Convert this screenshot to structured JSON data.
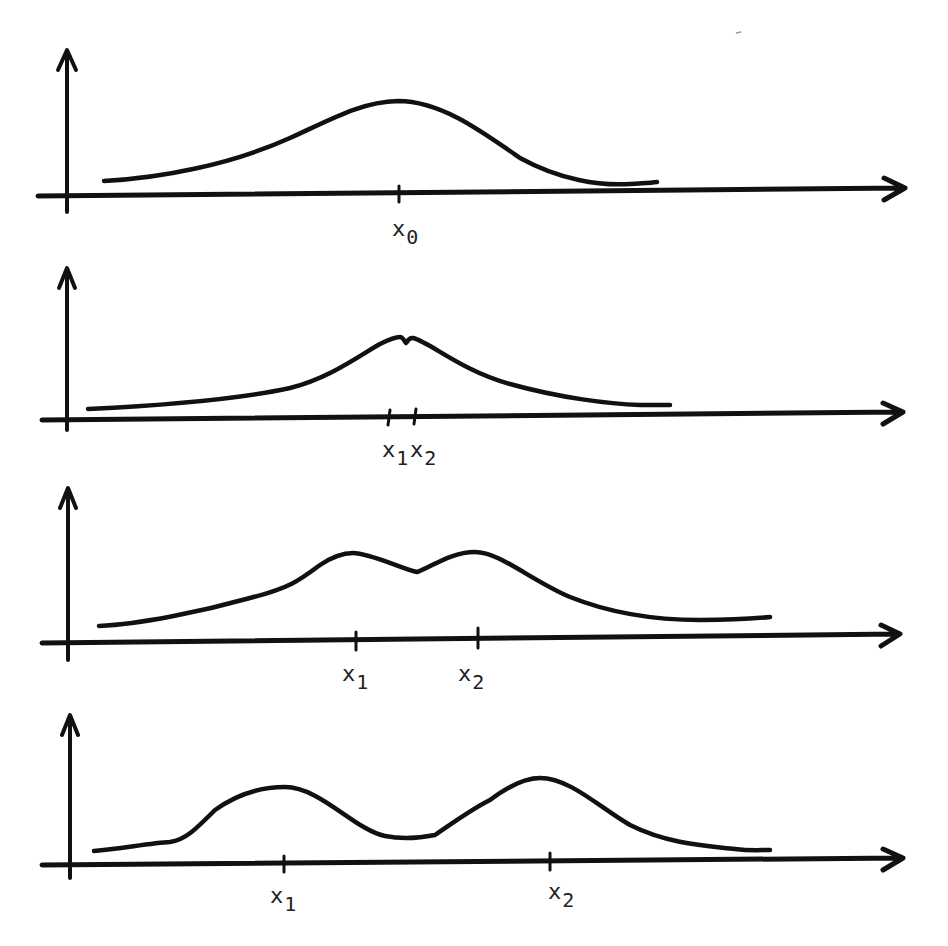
{
  "figure": {
    "panels": [
      {
        "id": "panel-1",
        "y_axis": {
          "x": 67,
          "top": 50,
          "bottom": 212
        },
        "x_axis": {
          "y": 193,
          "left": 38,
          "right": 905
        },
        "curve": "M104,181 C160,178 230,165 290,138 C330,120 360,102 398,101 C440,101 480,130 520,158 C560,180 600,186 630,184 C645,183 650,183 657,182",
        "ticks": [
          {
            "x": 399,
            "y": 193
          }
        ],
        "labels": [
          {
            "base": "x",
            "sub": "0",
            "x": 392,
            "y": 218
          }
        ]
      },
      {
        "id": "panel-2",
        "y_axis": {
          "x": 67,
          "top": 268,
          "bottom": 430
        },
        "x_axis": {
          "y": 414,
          "left": 42,
          "right": 903
        },
        "curve": "M88,409 C150,406 230,401 290,388 C330,378 360,355 380,344 C388,340 394,337 400,337 C403,337 405,342 406,343 C407,342 409,337 413,338 C430,342 460,370 510,384 C560,398 610,404 640,405 C655,405 665,405 670,405",
        "ticks": [
          {
            "x": 389,
            "y": 417
          },
          {
            "x": 415,
            "y": 416
          }
        ],
        "labels": [
          {
            "base": "x",
            "sub": "1",
            "x": 382,
            "y": 439
          },
          {
            "base": "x",
            "sub": "2",
            "x": 412,
            "y": 439
          }
        ]
      },
      {
        "id": "panel-3",
        "y_axis": {
          "x": 68,
          "top": 488,
          "bottom": 660
        },
        "x_axis": {
          "y": 640,
          "left": 42,
          "right": 900
        },
        "curve": "M99,626 C140,624 200,612 250,598 C290,588 300,580 320,565 C335,555 345,553 353,553 C370,553 405,570 417,572 C430,568 450,552 475,552 C500,552 530,580 570,597 C610,613 650,620 700,620 C730,620 750,619 770,617",
        "ticks": [
          {
            "x": 356,
            "y": 640
          },
          {
            "x": 478,
            "y": 636
          }
        ],
        "labels": [
          {
            "base": "x",
            "sub": "1",
            "x": 342,
            "y": 663
          },
          {
            "base": "x",
            "sub": "2",
            "x": 458,
            "y": 663
          }
        ]
      },
      {
        "id": "panel-4",
        "y_axis": {
          "x": 70,
          "top": 715,
          "bottom": 878
        },
        "x_axis": {
          "y": 861,
          "left": 42,
          "right": 903
        },
        "curve": "M94,851 C120,849 150,843 170,842 C185,840 195,830 215,810 C240,792 265,787 285,787 C320,787 355,830 385,836 C400,839 420,838 435,835 C450,825 470,810 490,800 C510,785 525,778 540,778 C570,778 600,808 630,825 C670,845 710,846 735,849 C750,851 760,850 770,850",
        "ticks": [
          {
            "x": 284,
            "y": 863
          },
          {
            "x": 550,
            "y": 861
          }
        ],
        "labels": [
          {
            "base": "x",
            "sub": "1",
            "x": 270,
            "y": 885
          },
          {
            "base": "x",
            "sub": "2",
            "x": 548,
            "y": 881
          }
        ]
      }
    ]
  }
}
